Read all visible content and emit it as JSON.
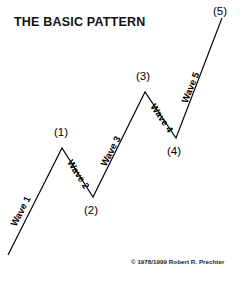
{
  "figure": {
    "title": "THE BASIC PATTERN",
    "copyright": "© 1978/1999 Robert R. Prechter",
    "background_color": "#ffffff",
    "line_color": "#000000",
    "text_color": "#000000"
  },
  "chart_data": {
    "type": "line",
    "title": "THE BASIC PATTERN",
    "subtitle": "",
    "xlabel": "",
    "ylabel": "",
    "grid": false,
    "legend": "none",
    "xlim": [
      0,
      245
    ],
    "ylim": [
      0,
      286
    ],
    "series": [
      {
        "name": "Impulse wave path",
        "points": [
          {
            "label": "start",
            "x": 8,
            "y": 255
          },
          {
            "label": "(1)",
            "x": 62,
            "y": 148
          },
          {
            "label": "(2)",
            "x": 93,
            "y": 197
          },
          {
            "label": "(3)",
            "x": 145,
            "y": 92
          },
          {
            "label": "(4)",
            "x": 176,
            "y": 138
          },
          {
            "label": "(5)",
            "x": 222,
            "y": 18
          }
        ]
      }
    ],
    "pivot_labels": [
      "(1)",
      "(2)",
      "(3)",
      "(4)",
      "(5)"
    ],
    "segment_labels": [
      "Wave 1",
      "Wave 2",
      "Wave 3",
      "Wave 4",
      "Wave 5"
    ]
  },
  "pivots": [
    {
      "id": "pivot-1",
      "text": "(1)",
      "x": 54,
      "y": 126
    },
    {
      "id": "pivot-2",
      "text": "(2)",
      "x": 84,
      "y": 204
    },
    {
      "id": "pivot-3",
      "text": "(3)",
      "x": 136,
      "y": 70
    },
    {
      "id": "pivot-4",
      "text": "(4)",
      "x": 167,
      "y": 145
    },
    {
      "id": "pivot-5",
      "text": "(5)",
      "x": 213,
      "y": 5
    }
  ],
  "waves": [
    {
      "id": "wave-1",
      "text": "Wave 1",
      "x": 13,
      "y": 220,
      "rotation": -63
    },
    {
      "id": "wave-2",
      "text": "Wave 2",
      "x": 70,
      "y": 155,
      "rotation": 58
    },
    {
      "id": "wave-3",
      "text": "Wave 3",
      "x": 103,
      "y": 160,
      "rotation": -63
    },
    {
      "id": "wave-4",
      "text": "Wave 4",
      "x": 153,
      "y": 99,
      "rotation": 56
    },
    {
      "id": "wave-5",
      "text": "Wave 5",
      "x": 184,
      "y": 97,
      "rotation": -68
    }
  ]
}
